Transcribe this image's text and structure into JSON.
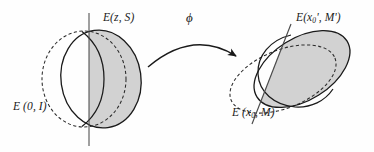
{
  "figure": {
    "type": "geometric-diagram",
    "width": 374,
    "height": 152,
    "background_color": "#fefefe",
    "stroke_color": "#1a1a1a",
    "shade_color": "#d2d2d2"
  },
  "labels": {
    "left_upper": {
      "name": "E(z, S)",
      "base": "E",
      "args": "(z, S)"
    },
    "left_lower": {
      "name": "E (0, I)",
      "base": "E",
      "args": "(0, I)"
    },
    "map": {
      "symbol": "ϕ",
      "name": "phi"
    },
    "right_upper": {
      "name": "E(x0', M')",
      "base": "E",
      "arg_head": "(x",
      "arg_sub": "0",
      "arg_tail": "', M')"
    },
    "right_lower": {
      "name": "E (x0, M)",
      "base": "E",
      "arg_head": "(x",
      "arg_sub": "0",
      "arg_tail": ", M)"
    }
  },
  "shapes": {
    "left": {
      "solid_ellipse": {
        "cx": 101,
        "cy": 79,
        "rx": 40,
        "ry": 49,
        "rotation": -8,
        "style": "solid",
        "label_ref": "left_upper"
      },
      "dashed_ellipse": {
        "cx": 84,
        "cy": 79,
        "rx": 42,
        "ry": 48,
        "rotation": 0,
        "style": "dashed",
        "label_ref": "left_lower"
      },
      "chord_line": {
        "x1": 89,
        "y1": 13,
        "x2": 89,
        "y2": 146,
        "orientation": "vertical"
      },
      "shaded_side": "right"
    },
    "right": {
      "solid_ellipse": {
        "cx": 302,
        "cy": 69,
        "rx": 53,
        "ry": 31,
        "rotation": -32,
        "style": "solid",
        "label_ref": "right_upper"
      },
      "dashed_ellipse": {
        "cx": 283,
        "cy": 79,
        "rx": 56,
        "ry": 29,
        "rotation": -22,
        "style": "dashed",
        "label_ref": "right_lower"
      },
      "chord_line": {
        "x1": 289,
        "y1": 26,
        "x2": 253,
        "y2": 123,
        "orientation": "diagonal"
      },
      "shaded_side": "right"
    },
    "arrow": {
      "name": "phi-arrow",
      "start": {
        "x": 148,
        "y": 67
      },
      "control": {
        "x": 192,
        "y": 30
      },
      "end": {
        "x": 238,
        "y": 57
      },
      "head": "filled-triangle"
    }
  }
}
